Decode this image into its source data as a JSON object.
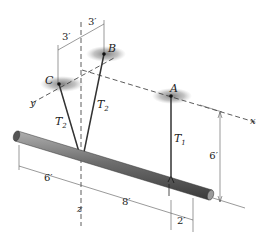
{
  "figure": {
    "points": {
      "A": "A",
      "B": "B",
      "C": "C"
    },
    "axes": {
      "x": "x",
      "y": "y",
      "z": "z"
    },
    "tensions": {
      "t1": "T",
      "t1_sub": "1",
      "t2_left": "T",
      "t2_left_sub": "2",
      "t2_right": "T",
      "t2_right_sub": "2"
    },
    "dimensions": {
      "top_left": "3′",
      "top_right": "3′",
      "height": "6′",
      "bottom_left": "6′",
      "bottom_mid": "8′",
      "bottom_right": "2′"
    },
    "colors": {
      "bar": "#6b6b6b",
      "bar_highlight": "#a8a8a8",
      "bar_shadow": "#3a3a3a",
      "support_shadow": "#8a8a8a",
      "lines": "#333333"
    }
  }
}
